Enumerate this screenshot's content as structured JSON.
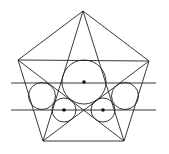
{
  "diagram": {
    "stroke_color": "#222222",
    "background": "#ffffff",
    "vertices": {
      "top": [
        83,
        11
      ],
      "upper_left": [
        18,
        60
      ],
      "upper_right": [
        149,
        61
      ],
      "lower_left": [
        43,
        141
      ],
      "lower_right": [
        124,
        141
      ]
    },
    "pentagon_edges": [
      [
        [
          83,
          11
        ],
        [
          18,
          60
        ]
      ],
      [
        [
          83,
          11
        ],
        [
          149,
          61
        ]
      ],
      [
        [
          18,
          60
        ],
        [
          43,
          141
        ]
      ],
      [
        [
          149,
          61
        ],
        [
          124,
          141
        ]
      ],
      [
        [
          43,
          141
        ],
        [
          124,
          141
        ]
      ]
    ],
    "pentagram_edges": [
      [
        [
          83,
          11
        ],
        [
          43,
          141
        ]
      ],
      [
        [
          83,
          11
        ],
        [
          124,
          141
        ]
      ],
      [
        [
          18,
          60
        ],
        [
          149,
          61
        ]
      ],
      [
        [
          18,
          60
        ],
        [
          124,
          141
        ]
      ],
      [
        [
          149,
          61
        ],
        [
          43,
          141
        ]
      ]
    ],
    "horizontal_lines": [
      [
        [
          11,
          83
        ],
        [
          156,
          83
        ]
      ],
      [
        [
          11,
          110
        ],
        [
          156,
          110
        ]
      ]
    ],
    "circles": [
      {
        "name": "large-center",
        "cx": 84,
        "cy": 82,
        "r": 22,
        "center_marked": true
      },
      {
        "name": "left",
        "cx": 42,
        "cy": 96,
        "r": 13.5,
        "center_marked": false
      },
      {
        "name": "right",
        "cx": 125,
        "cy": 96,
        "r": 13.5,
        "center_marked": false
      },
      {
        "name": "lower-left-small",
        "cx": 64,
        "cy": 110,
        "r": 12,
        "center_marked": true
      },
      {
        "name": "lower-right-small",
        "cx": 103,
        "cy": 110,
        "r": 12,
        "center_marked": true
      }
    ]
  }
}
